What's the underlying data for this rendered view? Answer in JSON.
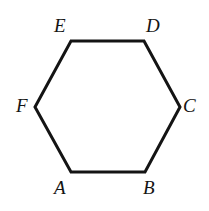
{
  "figure": {
    "type": "geometry-diagram",
    "shape_name": "hexagon",
    "background_color": "#ffffff",
    "stroke_color": "#141414",
    "stroke_width": 3,
    "fill_color": "none",
    "canvas": {
      "width": 209,
      "height": 211
    },
    "vertices": [
      {
        "id": "A",
        "label": "A",
        "x": 71,
        "y": 172,
        "label_x": 54,
        "label_y": 178
      },
      {
        "id": "B",
        "label": "B",
        "x": 145,
        "y": 172,
        "label_x": 143,
        "label_y": 178
      },
      {
        "id": "C",
        "label": "C",
        "x": 180,
        "y": 107,
        "label_x": 183,
        "label_y": 96
      },
      {
        "id": "D",
        "label": "D",
        "x": 144,
        "y": 41,
        "label_x": 146,
        "label_y": 16
      },
      {
        "id": "E",
        "label": "E",
        "x": 71,
        "y": 41,
        "label_x": 54,
        "label_y": 16
      },
      {
        "id": "F",
        "label": "F",
        "x": 35,
        "y": 107,
        "label_x": 16,
        "label_y": 96
      }
    ],
    "polygon_points": "71,172 145,172 180,107 144,41 71,41 35,107"
  }
}
